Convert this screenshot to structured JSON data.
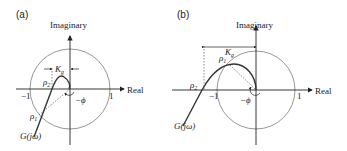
{
  "panels": [
    {
      "id": "a",
      "label": "(a)",
      "axis_x": "Real",
      "axis_y": "Imaginary",
      "tick_neg": "−1",
      "tick_pos": "1",
      "kg": "K",
      "kg_sub": "g",
      "rho1": "ρ",
      "rho1_sub": "1",
      "rho2": "ρ",
      "rho2_sub": "2",
      "phi": "−ϕ",
      "curve": "G(jω)"
    },
    {
      "id": "b",
      "label": "(b)",
      "axis_x": "Real",
      "axis_y": "Imaginary",
      "tick_neg": "−1",
      "tick_pos": "1",
      "kg": "K",
      "kg_sub": "g",
      "rho1": "ρ",
      "rho1_sub": "1",
      "rho2": "ρ",
      "rho2_sub": "2",
      "phi": "−ϕ",
      "curve": "G(jω)"
    }
  ],
  "colors": {
    "axis": "#222222",
    "circle": "#8a8a8a",
    "curve": "#333333",
    "dotted": "#555555"
  }
}
